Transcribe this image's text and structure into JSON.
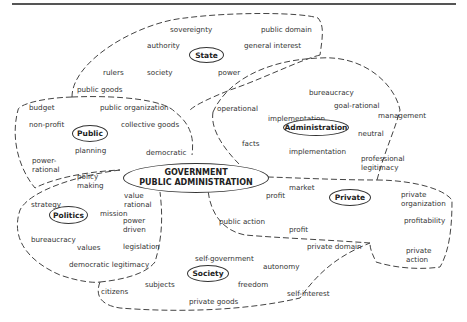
{
  "diagram": {
    "center": {
      "line1": "GOVERNMENT",
      "line2": "PUBLIC ADMINISTRATION"
    },
    "clusters": {
      "state": {
        "label": "State",
        "words": [
          "sovereignty",
          "public domain",
          "authority",
          "general interest",
          "rulers",
          "society",
          "power",
          "public goods"
        ]
      },
      "public": {
        "label": "Public",
        "words": [
          "budget",
          "public organization",
          "non-profit",
          "collective goods",
          "planning",
          "democratic",
          "power-\nrational"
        ]
      },
      "administration": {
        "label": "Administration",
        "words": [
          "bureaucracy",
          "implementation",
          "operational",
          "goal-rational",
          "management",
          "neutral",
          "facts",
          "implementation",
          "professional\nlegitimacy"
        ]
      },
      "politics": {
        "label": "Politics",
        "words": [
          "policy\nmaking",
          "value\nrational",
          "strategy",
          "mission",
          "power\ndriven",
          "bureaucracy",
          "values",
          "legislation",
          "democratic legitimacy"
        ]
      },
      "private": {
        "label": "Private",
        "words": [
          "market",
          "profit",
          "private\norganization",
          "profitability",
          "public action",
          "profit",
          "private domain",
          "private\naction"
        ]
      },
      "society": {
        "label": "Society",
        "words": [
          "self-government",
          "autonomy",
          "subjects",
          "freedom",
          "citizens",
          "self-interest",
          "private goods"
        ]
      }
    }
  }
}
